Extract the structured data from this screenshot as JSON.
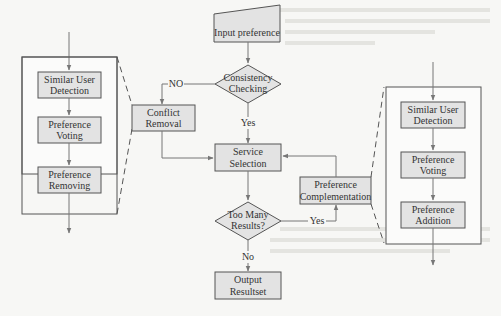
{
  "diagram": {
    "main_flow": {
      "input": "Input preference",
      "consistency_line1": "Consistency",
      "consistency_line2": "Checking",
      "no_label": "NO",
      "yes_label": "Yes",
      "conflict_line1": "Conflict",
      "conflict_line2": "Removal",
      "service_line1": "Service",
      "service_line2": "Selection",
      "too_many_line1": "Too Many",
      "too_many_line2": "Results?",
      "yes2_label": "Yes",
      "no2_label": "No",
      "output_line1": "Output",
      "output_line2": "Resultset",
      "complement_line1": "Preference",
      "complement_line2": "Complementation"
    },
    "left_detail": {
      "step1_line1": "Similar User",
      "step1_line2": "Detection",
      "step2_line1": "Preference",
      "step2_line2": "Voting",
      "step3_line1": "Preference",
      "step3_line2": "Removing"
    },
    "right_detail": {
      "step1_line1": "Similar User",
      "step1_line2": "Detection",
      "step2_line1": "Preference",
      "step2_line2": "Voting",
      "step3_line1": "Preference",
      "step3_line2": "Addition"
    },
    "colors": {
      "box_fill": "#e3e3e3",
      "stroke": "#555555",
      "arrow": "#777777"
    }
  }
}
